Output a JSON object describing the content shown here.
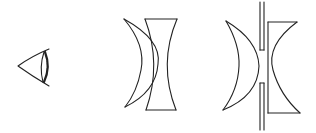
{
  "diagram": {
    "type": "optics-lens-diagram",
    "background": "#ffffff",
    "stroke_color": "#222222",
    "elements": [
      {
        "id": "eye",
        "label": "Eye"
      },
      {
        "id": "meniscus-biconcave-pair",
        "label": "Meniscus lens with biconcave lens"
      },
      {
        "id": "meniscus-stop-planoconcave",
        "label": "Meniscus lens, aperture stop and plano-concave lens"
      }
    ]
  }
}
